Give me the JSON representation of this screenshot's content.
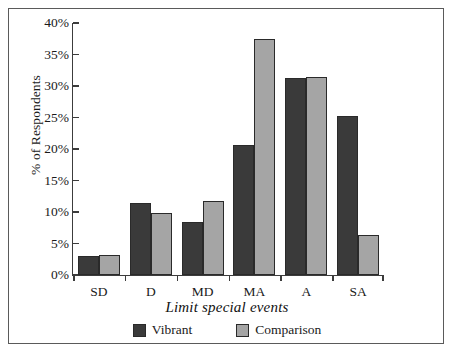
{
  "chart_data": {
    "type": "bar",
    "title": "",
    "xlabel": "Limit special events",
    "ylabel": "% of Respondents",
    "categories": [
      "SD",
      "D",
      "MD",
      "MA",
      "A",
      "SA"
    ],
    "series": [
      {
        "name": "Vibrant",
        "color": "#3a3a3a",
        "values": [
          3.0,
          11.5,
          8.4,
          20.6,
          31.3,
          25.3
        ]
      },
      {
        "name": "Comparison",
        "color": "#a5a5a5",
        "values": [
          3.2,
          9.8,
          11.8,
          37.4,
          31.5,
          6.4
        ]
      }
    ],
    "ylim": [
      0,
      40
    ],
    "ytick_values": [
      0,
      5,
      10,
      15,
      20,
      25,
      30,
      35,
      40
    ],
    "ytick_labels": [
      "0%",
      "5%",
      "10%",
      "15%",
      "20%",
      "25%",
      "30%",
      "35%",
      "40%"
    ],
    "grid": false,
    "legend_position": "bottom"
  },
  "legend": {
    "items": [
      {
        "label": "Vibrant",
        "color": "#3a3a3a"
      },
      {
        "label": "Comparison",
        "color": "#a5a5a5"
      }
    ]
  }
}
